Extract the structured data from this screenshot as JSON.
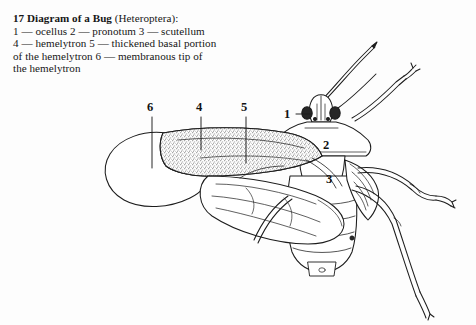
{
  "figure": {
    "number": "17",
    "title": "Diagram of a Bug",
    "taxon": "(Heteroptera):",
    "caption_lines": [
      "1 — ocellus 2 — pronotum 3 — scutellum",
      "4 — hemelytron 5 — thickened basal portion",
      "of the hemelytron 6 — membranous tip of",
      "the hemelytron"
    ],
    "caption_full": "17 Diagram of a Bug (Heteroptera): 1 — ocellus 2 — pronotum 3 — scutellum 4 — hemelytron 5 — thickened basal portion of the hemelytron 6 — membranous tip of the hemelytron"
  },
  "legend": [
    {
      "key": "1",
      "term": "ocellus"
    },
    {
      "key": "2",
      "term": "pronotum"
    },
    {
      "key": "3",
      "term": "scutellum"
    },
    {
      "key": "4",
      "term": "hemelytron"
    },
    {
      "key": "5",
      "term": "thickened basal portion of the hemelytron"
    },
    {
      "key": "6",
      "term": "membranous tip of the hemelytron"
    }
  ],
  "callouts": {
    "one": "1",
    "two": "2",
    "three": "3",
    "four": "4",
    "five": "5",
    "six": "6"
  },
  "colors": {
    "background": "#fdfdfd",
    "ink": "#1a1a1a",
    "stipple": "#9a9a9a",
    "eye_fill": "#2a2a2a"
  }
}
